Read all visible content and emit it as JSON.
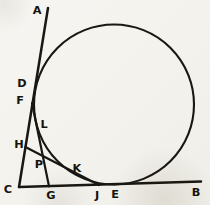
{
  "figure": {
    "width": 210,
    "height": 205,
    "background_color": "#f3f2ed",
    "ink_color": "#1a1712"
  },
  "diagram": {
    "type": "geometry-figure",
    "circle": {
      "cx": 114,
      "cy": 104.5,
      "r": 80
    },
    "lines": [
      {
        "name": "line-AC",
        "from": "A",
        "to": "C",
        "x1": 48,
        "y1": 8,
        "x2": 19,
        "y2": 187,
        "width": 2.5
      },
      {
        "name": "line-CB",
        "from": "C",
        "to": "B",
        "x1": 19,
        "y1": 187,
        "x2": 201,
        "y2": 181.5,
        "width": 2.5
      },
      {
        "name": "line-FG",
        "from": "F",
        "to": "G",
        "x1": 32,
        "y1": 103,
        "x2": 49,
        "y2": 186.3,
        "width": 2.2
      },
      {
        "name": "line-HJ",
        "from": "H",
        "to": "J",
        "x1": 25.4,
        "y1": 147,
        "x2": 99,
        "y2": 185,
        "width": 2.2
      }
    ],
    "labels": [
      {
        "text": "A",
        "x": 37,
        "y": 10
      },
      {
        "text": "B",
        "x": 196,
        "y": 192
      },
      {
        "text": "C",
        "x": 8,
        "y": 189
      },
      {
        "text": "D",
        "x": 22,
        "y": 83
      },
      {
        "text": "F",
        "x": 20,
        "y": 100
      },
      {
        "text": "L",
        "x": 44,
        "y": 124
      },
      {
        "text": "H",
        "x": 19,
        "y": 144
      },
      {
        "text": "P",
        "x": 39,
        "y": 164
      },
      {
        "text": "K",
        "x": 77,
        "y": 168
      },
      {
        "text": "G",
        "x": 51,
        "y": 195
      },
      {
        "text": "J",
        "x": 97,
        "y": 195
      },
      {
        "text": "E",
        "x": 115,
        "y": 194
      }
    ],
    "tangent_points": [
      {
        "label": "D",
        "on_line": "line-AC",
        "x": 34.4,
        "y": 91.5
      },
      {
        "label": "E",
        "on_line": "line-CB",
        "x": 116,
        "y": 184.5
      },
      {
        "label": "L",
        "on_line": "line-FG",
        "x": 35.6,
        "y": 120.8
      },
      {
        "label": "K",
        "on_line": "line-HJ",
        "x": 76.8,
        "y": 174.7
      }
    ],
    "intersections": [
      {
        "label": "P",
        "of": [
          "line-FG",
          "line-HJ"
        ],
        "x": 42.9,
        "y": 156.3
      }
    ]
  }
}
